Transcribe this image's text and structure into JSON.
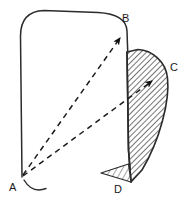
{
  "figure": {
    "background_color": "#ffffff",
    "stroke_color": "#2b2b2b",
    "hatch_color": "#3a3a3a",
    "width": 185,
    "height": 200
  },
  "labels": {
    "a": "A",
    "b": "B",
    "c": "C",
    "d": "D"
  },
  "label_positions": {
    "a": {
      "x": 9,
      "y": 191
    },
    "b": {
      "x": 122,
      "y": 22
    },
    "c": {
      "x": 170,
      "y": 71
    },
    "d": {
      "x": 114,
      "y": 193
    }
  },
  "points": {
    "a": {
      "x": 22,
      "y": 177
    },
    "b": {
      "x": 127,
      "y": 30
    },
    "c": {
      "x": 166,
      "y": 74
    },
    "d": {
      "x": 131,
      "y": 182
    }
  },
  "arrows": [
    {
      "name": "arrow-a-to-b",
      "from": "A",
      "to": "B",
      "style": "dashed"
    },
    {
      "name": "arrow-a-to-c",
      "from": "A",
      "to": "C",
      "style": "dashed"
    }
  ],
  "shapes": [
    {
      "name": "base-panel",
      "fill": "none",
      "description": "rounded outline panel A-B"
    },
    {
      "name": "rotated-flap",
      "fill": "hatched",
      "description": "hatched curved flap B-C-D"
    },
    {
      "name": "foot-triangle",
      "fill": "hatched",
      "description": "small hatched triangle at D"
    }
  ],
  "rotation_marker": {
    "name": "rotation-arc",
    "description": "small arc at point A indicating rotation axis"
  }
}
